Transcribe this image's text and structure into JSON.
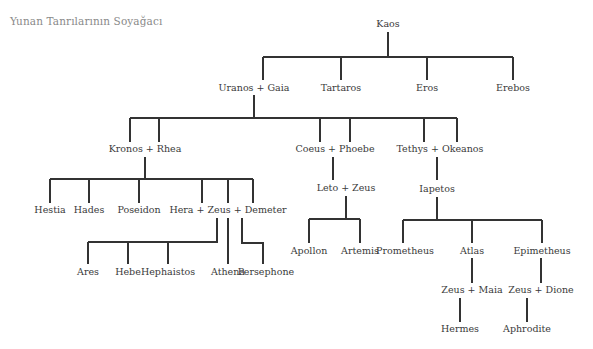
{
  "title": "Yunan Tanrılarının Soyağacı",
  "colors": {
    "line": "#333333",
    "text": "#3a3a3a",
    "title": "#8a8a8a",
    "background": "#ffffff"
  },
  "nodes": {
    "kaos": "Kaos",
    "uranos_gaia": "Uranos + Gaia",
    "tartaros": "Tartaros",
    "eros": "Eros",
    "erebos": "Erebos",
    "kronos_rhea": "Kronos + Rhea",
    "coeus_phoebe": "Coeus + Phoebe",
    "tethys_okeanos": "Tethys + Okeanos",
    "hestia": "Hestia",
    "hades": "Hades",
    "poseidon": "Poseidon",
    "hera_zeus_demeter": "Hera + Zeus + Demeter",
    "leto_zeus": "Leto + Zeus",
    "iapetos": "Iapetos",
    "ares": "Ares",
    "hebe": "Hebe",
    "hephaistos": "Hephaistos",
    "athena": "Athena",
    "persephone": "Persephone",
    "apollon": "Apollon",
    "artemis": "Artemis",
    "prometheus": "Prometheus",
    "atlas": "Atlas",
    "epimetheus": "Epimetheus",
    "zeus_maia": "Zeus + Maia",
    "zeus_dione": "Zeus + Dione",
    "hermes": "Hermes",
    "aphrodite": "Aphrodite"
  }
}
